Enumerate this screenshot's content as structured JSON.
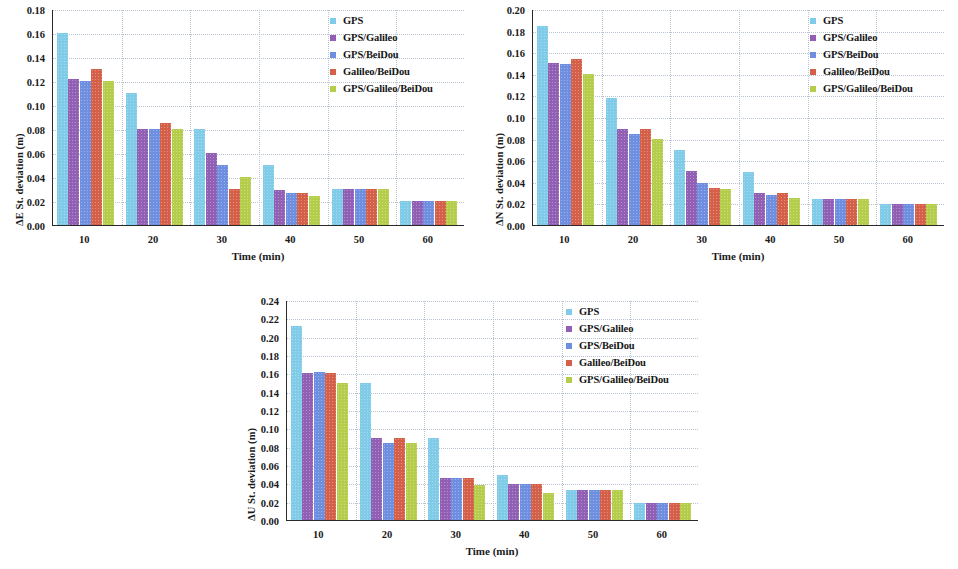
{
  "series_names": [
    "GPS",
    "GPS/Galileo",
    "GPS/BeiDou",
    "Galileo/BeiDou",
    "GPS/Galileo/BeiDou"
  ],
  "colors": {
    "gps": "#7FCBE8",
    "gps_galileo": "#9160B4",
    "gps_beidou": "#6E8FE0",
    "galileo_beidou": "#D4604A",
    "gps_galileo_beidou": "#B4CD4B",
    "axis": "#2a2a2a",
    "grid": "#b9c4d2",
    "text": "#1a1a1a"
  },
  "legend": {
    "items": [
      {
        "label": "GPS",
        "color": "#7FCBE8"
      },
      {
        "label": "GPS/Galileo",
        "color": "#9160B4"
      },
      {
        "label": "GPS/BeiDou",
        "color": "#6E8FE0"
      },
      {
        "label": "Galileo/BeiDou",
        "color": "#D4604A"
      },
      {
        "label": "GPS/Galileo/BeiDou",
        "color": "#B4CD4B"
      }
    ]
  },
  "chart_data": [
    {
      "id": "east",
      "type": "bar",
      "title": "",
      "xlabel": "Time (min)",
      "ylabel": "ΔE St. deviation (m)",
      "categories": [
        "10",
        "20",
        "30",
        "40",
        "50",
        "60"
      ],
      "xticklabels": [
        "10",
        "20",
        "30",
        "40",
        "50",
        "60"
      ],
      "yticklabels": [
        "0.00",
        "0.02",
        "0.04",
        "0.06",
        "0.08",
        "0.10",
        "0.12",
        "0.14",
        "0.16",
        "0.18"
      ],
      "yticks": [
        0.0,
        0.02,
        0.04,
        0.06,
        0.08,
        0.1,
        0.12,
        0.14,
        0.16,
        0.18
      ],
      "ylim": [
        0,
        0.18
      ],
      "grid": true,
      "legend_position": "upper right",
      "series": [
        {
          "name": "GPS",
          "color": "#7FCBE8",
          "values": [
            0.16,
            0.11,
            0.08,
            0.05,
            0.03,
            0.02
          ]
        },
        {
          "name": "GPS/Galileo",
          "color": "#9160B4",
          "values": [
            0.122,
            0.08,
            0.06,
            0.029,
            0.03,
            0.02
          ]
        },
        {
          "name": "GPS/BeiDou",
          "color": "#6E8FE0",
          "values": [
            0.12,
            0.08,
            0.05,
            0.027,
            0.03,
            0.02
          ]
        },
        {
          "name": "Galileo/BeiDou",
          "color": "#D4604A",
          "values": [
            0.13,
            0.085,
            0.03,
            0.027,
            0.03,
            0.02
          ]
        },
        {
          "name": "GPS/Galileo/BeiDou",
          "color": "#B4CD4B",
          "values": [
            0.12,
            0.08,
            0.04,
            0.024,
            0.03,
            0.02
          ]
        }
      ]
    },
    {
      "id": "north",
      "type": "bar",
      "title": "",
      "xlabel": "Time (min)",
      "ylabel": "ΔN St. deviation (m)",
      "categories": [
        "10",
        "20",
        "30",
        "40",
        "50",
        "60"
      ],
      "xticklabels": [
        "10",
        "20",
        "30",
        "40",
        "50",
        "60"
      ],
      "yticklabels": [
        "0.00",
        "0.02",
        "0.04",
        "0.06",
        "0.08",
        "0.10",
        "0.12",
        "0.14",
        "0.16",
        "0.18",
        "0.20"
      ],
      "yticks": [
        0.0,
        0.02,
        0.04,
        0.06,
        0.08,
        0.1,
        0.12,
        0.14,
        0.16,
        0.18,
        0.2
      ],
      "ylim": [
        0,
        0.2
      ],
      "grid": true,
      "legend_position": "upper right",
      "series": [
        {
          "name": "GPS",
          "color": "#7FCBE8",
          "values": [
            0.184,
            0.118,
            0.069,
            0.049,
            0.024,
            0.019
          ]
        },
        {
          "name": "GPS/Galileo",
          "color": "#9160B4",
          "values": [
            0.15,
            0.089,
            0.05,
            0.03,
            0.024,
            0.019
          ]
        },
        {
          "name": "GPS/BeiDou",
          "color": "#6E8FE0",
          "values": [
            0.149,
            0.084,
            0.039,
            0.028,
            0.024,
            0.019
          ]
        },
        {
          "name": "Galileo/BeiDou",
          "color": "#D4604A",
          "values": [
            0.154,
            0.089,
            0.034,
            0.03,
            0.024,
            0.019
          ]
        },
        {
          "name": "GPS/Galileo/BeiDou",
          "color": "#B4CD4B",
          "values": [
            0.14,
            0.08,
            0.033,
            0.025,
            0.024,
            0.019
          ]
        }
      ]
    },
    {
      "id": "up",
      "type": "bar",
      "title": "",
      "xlabel": "Time (min)",
      "ylabel": "ΔU St. deviation (m)",
      "categories": [
        "10",
        "20",
        "30",
        "40",
        "50",
        "60"
      ],
      "xticklabels": [
        "10",
        "20",
        "30",
        "40",
        "50",
        "60"
      ],
      "yticklabels": [
        "0.00",
        "0.02",
        "0.04",
        "0.06",
        "0.08",
        "0.10",
        "0.12",
        "0.14",
        "0.16",
        "0.18",
        "0.20",
        "0.22",
        "0.24"
      ],
      "yticks": [
        0.0,
        0.02,
        0.04,
        0.06,
        0.08,
        0.1,
        0.12,
        0.14,
        0.16,
        0.18,
        0.2,
        0.22,
        0.24
      ],
      "ylim": [
        0,
        0.24
      ],
      "grid": true,
      "legend_position": "upper right",
      "series": [
        {
          "name": "GPS",
          "color": "#7FCBE8",
          "values": [
            0.212,
            0.149,
            0.089,
            0.049,
            0.033,
            0.019
          ]
        },
        {
          "name": "GPS/Galileo",
          "color": "#9160B4",
          "values": [
            0.16,
            0.089,
            0.046,
            0.039,
            0.033,
            0.019
          ]
        },
        {
          "name": "GPS/BeiDou",
          "color": "#6E8FE0",
          "values": [
            0.161,
            0.084,
            0.046,
            0.039,
            0.033,
            0.019
          ]
        },
        {
          "name": "Galileo/BeiDou",
          "color": "#D4604A",
          "values": [
            0.16,
            0.089,
            0.046,
            0.039,
            0.033,
            0.019
          ]
        },
        {
          "name": "GPS/Galileo/BeiDou",
          "color": "#B4CD4B",
          "values": [
            0.149,
            0.084,
            0.038,
            0.029,
            0.033,
            0.019
          ]
        }
      ]
    }
  ]
}
